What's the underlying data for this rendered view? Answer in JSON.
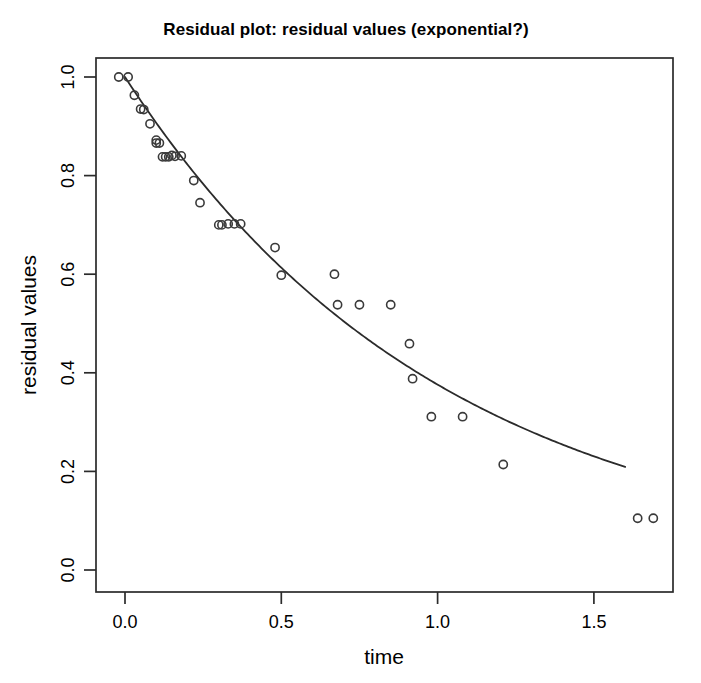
{
  "chart_data": {
    "type": "scatter",
    "title": "Residual plot:  residual values (exponential?)",
    "xlabel": "time",
    "ylabel": "residual values",
    "xlim": [
      -0.06,
      1.76
    ],
    "ylim": [
      -0.03,
      1.04
    ],
    "xticks": [
      "0.0",
      "0.5",
      "1.0",
      "1.5"
    ],
    "xtick_values": [
      0.0,
      0.5,
      1.0,
      1.5
    ],
    "yticks": [
      "0.0",
      "0.2",
      "0.4",
      "0.6",
      "0.8",
      "1.0"
    ],
    "ytick_values": [
      0.0,
      0.2,
      0.4,
      0.6,
      0.8,
      1.0
    ],
    "grid": false,
    "legend": "none",
    "point_marker": "open-circle",
    "series": [
      {
        "name": "residual values",
        "x": [
          -0.02,
          0.01,
          0.03,
          0.05,
          0.06,
          0.08,
          0.1,
          0.1,
          0.11,
          0.12,
          0.13,
          0.14,
          0.15,
          0.16,
          0.18,
          0.22,
          0.24,
          0.3,
          0.31,
          0.33,
          0.35,
          0.37,
          0.48,
          0.5,
          0.67,
          0.68,
          0.75,
          0.85,
          0.91,
          0.92,
          0.98,
          1.08,
          1.21,
          1.64,
          1.69
        ],
        "y": [
          1.0,
          1.0,
          0.963,
          0.935,
          0.934,
          0.905,
          0.872,
          0.866,
          0.866,
          0.838,
          0.838,
          0.838,
          0.841,
          0.839,
          0.84,
          0.79,
          0.745,
          0.7,
          0.7,
          0.702,
          0.702,
          0.702,
          0.654,
          0.598,
          0.6,
          0.538,
          0.538,
          0.538,
          0.459,
          0.388,
          0.311,
          0.311,
          0.214,
          0.105,
          0.105
        ]
      }
    ],
    "fit_curve": {
      "name": "exponential fit",
      "model": "exponential decay",
      "x_start": 0.0,
      "x_end": 1.6,
      "amplitude": 1.0,
      "decay_rate": 0.978
    }
  }
}
